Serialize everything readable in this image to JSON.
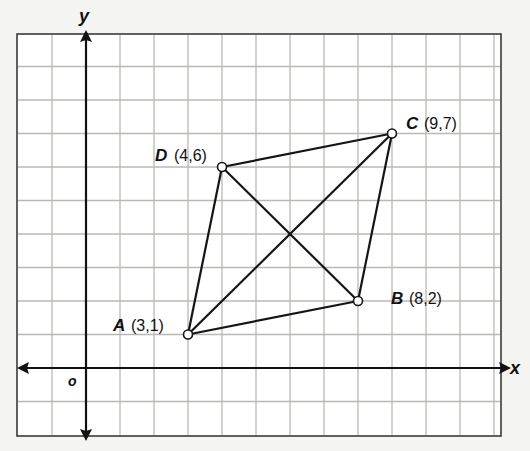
{
  "axes": {
    "x_label": "x",
    "y_label": "y",
    "origin_label": "o",
    "x_range": [
      -2,
      12
    ],
    "y_range": [
      -2,
      10
    ],
    "grid": true
  },
  "points": [
    {
      "name": "A",
      "coord_text": "(3,1)",
      "x": 3,
      "y": 1
    },
    {
      "name": "B",
      "coord_text": "(8,2)",
      "x": 8,
      "y": 2
    },
    {
      "name": "C",
      "coord_text": "(9,7)",
      "x": 9,
      "y": 7
    },
    {
      "name": "D",
      "coord_text": "(4,6)",
      "x": 4,
      "y": 6
    }
  ],
  "segments": [
    [
      "A",
      "B"
    ],
    [
      "B",
      "C"
    ],
    [
      "C",
      "D"
    ],
    [
      "D",
      "A"
    ],
    [
      "A",
      "C"
    ],
    [
      "B",
      "D"
    ]
  ],
  "colors": {
    "background": "#f4f4f2",
    "grid": "#b8b8b4",
    "ink": "#111111"
  },
  "chart_data": {
    "type": "scatter",
    "title": "",
    "xlabel": "x",
    "ylabel": "y",
    "xlim": [
      -2,
      12
    ],
    "ylim": [
      -2,
      10
    ],
    "grid": true,
    "series": [
      {
        "name": "Quadrilateral ABCD",
        "labels": [
          "A",
          "B",
          "C",
          "D"
        ],
        "x": [
          3,
          8,
          9,
          4
        ],
        "y": [
          1,
          2,
          7,
          6
        ]
      }
    ],
    "annotations": [
      "A (3,1)",
      "B (8,2)",
      "C (9,7)",
      "D (4,6)"
    ],
    "connections": [
      "AB",
      "BC",
      "CD",
      "DA",
      "AC",
      "BD"
    ]
  }
}
